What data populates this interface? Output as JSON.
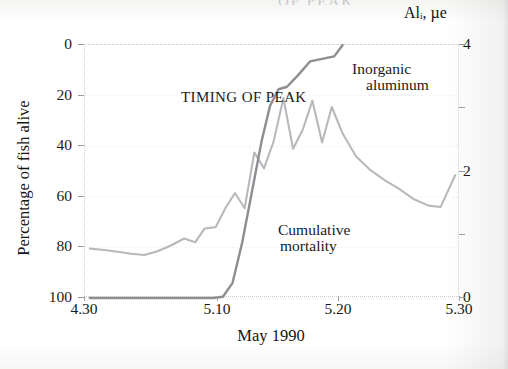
{
  "figure": {
    "title_remnant": "OF PEAK",
    "annotations": {
      "timing": "TIMING OF PEAK",
      "series_alum_line1": "Inorganic",
      "series_alum_line2": "aluminum",
      "series_mort_line1": "Cumulative",
      "series_mort_line2": "mortality"
    }
  },
  "chart_data": {
    "type": "line",
    "title": "TIMING OF PEAK",
    "xlabel": "May 1990",
    "ylabel": "Percentage of fish alive",
    "y2label": "Alᵢ, µe",
    "grid": true,
    "legend": "in-plot annotations",
    "x_tick_labels": [
      "4.30",
      "5.10",
      "5.20",
      "5.30"
    ],
    "x_tick_values": [
      0,
      11,
      21,
      31
    ],
    "xlim": [
      0,
      31
    ],
    "y_tick_labels": [
      "0",
      "20",
      "40",
      "60",
      "80",
      "100"
    ],
    "y_tick_values": [
      0,
      20,
      40,
      60,
      80,
      100
    ],
    "ylim": [
      0,
      100
    ],
    "y_inverted": true,
    "y2_tick_labels": [
      "4",
      "2",
      "0"
    ],
    "y2_tick_values": [
      4,
      2,
      0
    ],
    "y2lim": [
      0,
      4
    ],
    "series": [
      {
        "name": "Inorganic aluminum",
        "axis": "right",
        "color": "#b9b9bd",
        "units": "µeq/L",
        "x": [
          0.4,
          1.6,
          2.7,
          3.8,
          4.9,
          6.0,
          7.1,
          8.2,
          9.1,
          9.9,
          10.8,
          11.6,
          12.4,
          13.2,
          14.0,
          14.8,
          15.6,
          16.4,
          17.2,
          18.0,
          18.8,
          19.6,
          20.4,
          21.3,
          22.4,
          23.6,
          24.8,
          26.0,
          27.2,
          28.4,
          29.4,
          30.6
        ],
        "y": [
          0.78,
          0.76,
          0.73,
          0.7,
          0.68,
          0.74,
          0.83,
          0.94,
          0.88,
          1.1,
          1.12,
          1.42,
          1.66,
          1.42,
          2.3,
          2.05,
          2.48,
          3.16,
          2.36,
          2.66,
          3.12,
          2.46,
          3.02,
          2.6,
          2.24,
          2.02,
          1.86,
          1.72,
          1.56,
          1.46,
          1.44,
          1.94
        ]
      },
      {
        "name": "Cumulative mortality",
        "axis": "left",
        "color": "#8e8e92",
        "units": "percentage of fish alive",
        "x": [
          0.4,
          3.0,
          6.0,
          9.0,
          10.6,
          11.4,
          12.2,
          13.0,
          13.8,
          14.6,
          15.3,
          16.0,
          16.7,
          17.6,
          18.6,
          19.6,
          20.6,
          21.3
        ],
        "y": [
          100,
          100,
          100,
          100,
          100,
          99.5,
          94,
          78,
          58,
          38,
          24,
          17.5,
          16.5,
          12,
          6.5,
          5.5,
          4.5,
          0
        ]
      }
    ]
  }
}
